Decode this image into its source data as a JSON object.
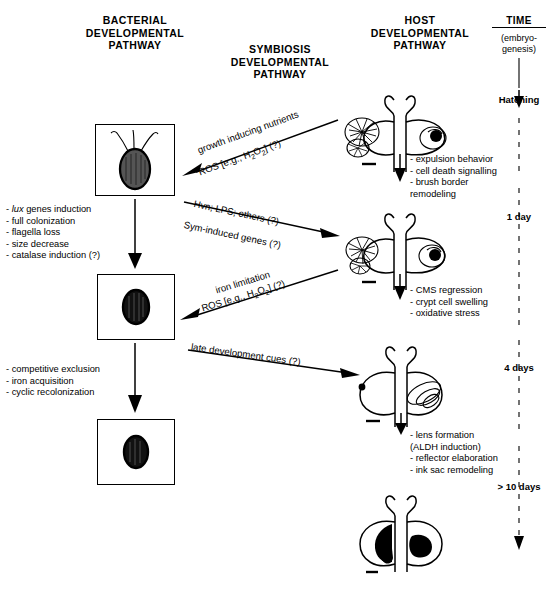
{
  "figure": {
    "columns": {
      "bacterial": "BACTERIAL\nDEVELOPMENTAL\nPATHWAY",
      "symbiosis": "SYMBIOSIS\nDEVELOPMENTAL\nPATHWAY",
      "host": "HOST\nDEVELOPMENTAL\nPATHWAY",
      "time": "TIME"
    }
  },
  "timeline": {
    "subtitle": "(embryo-\ngenesis)",
    "marks": [
      {
        "label": "Hatching"
      },
      {
        "label": "1 day"
      },
      {
        "label": "4 days"
      },
      {
        "label": "> 10 days"
      }
    ]
  },
  "bacterial": {
    "stages": [
      {
        "name": "flagellated-rod-bacterium"
      },
      {
        "name": "coccoid-bacterium-medium"
      },
      {
        "name": "coccoid-bacterium-small"
      }
    ],
    "notes": [
      "- lux genes induction\n- full colonization\n- flagella loss\n- size decrease\n- catalase induction (?)",
      "- competitive exclusion\n- iron acquisition\n- cyclic recolonization"
    ],
    "note1_italic_word": "lux"
  },
  "symbiosis": {
    "signals": [
      {
        "top": "growth inducing nutrients",
        "bottom": "ROS [e.g., H2O2] (?)",
        "direction": "to-bacteria"
      },
      {
        "top": "Hvn; LPS; others (?)",
        "bottom": "Sym-induced genes (?)",
        "direction": "to-host"
      },
      {
        "top": "iron limitation",
        "bottom": "ROS [e.g., H2O2] (?)",
        "direction": "to-bacteria"
      },
      {
        "top": "late development cues (?)",
        "bottom": "",
        "direction": "to-host"
      }
    ]
  },
  "host": {
    "stages": [
      {
        "name": "light-organ-hatchling-ciliated"
      },
      {
        "name": "light-organ-1day-ciliated"
      },
      {
        "name": "light-organ-4days-regressed"
      },
      {
        "name": "light-organ-mature-pigmented"
      }
    ],
    "notes": [
      "- expulsion behavior\n- cell death signalling\n- brush border\n    remodeling",
      "- CMS regression\n- crypt cell swelling\n- oxidative stress",
      "- lens formation\n  (ALDH induction)\n- reflector elaboration\n- ink sac remodeling"
    ]
  },
  "colors": {
    "ink": "#000000",
    "background": "#ffffff"
  }
}
